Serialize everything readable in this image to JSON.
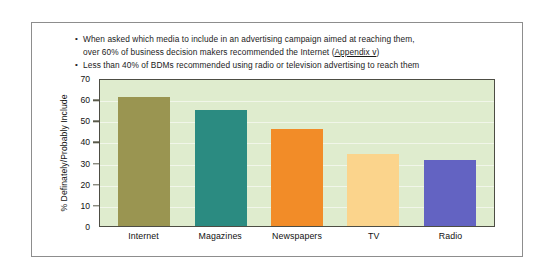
{
  "slide": {
    "bullets": [
      {
        "marker": "•",
        "line1": "When asked which media to include in an advertising campaign aimed at reaching them,",
        "line2_before": "over 60% of business decision makers recommended the Internet (",
        "line2_link": "Appendix v",
        "line2_after": ")"
      },
      {
        "marker": "•",
        "line1": "Less than 40% of BDMs recommended using radio or television advertising to reach them",
        "line2_before": "",
        "line2_link": "",
        "line2_after": ""
      }
    ]
  },
  "chart_data": {
    "type": "bar",
    "title": "",
    "xlabel": "",
    "ylabel": "% Definately/Probably Include",
    "ylim": [
      0,
      70
    ],
    "ytick_labels": [
      "70",
      "60",
      "50",
      "40",
      "30",
      "20",
      "10",
      "0"
    ],
    "ytick_values": [
      70,
      60,
      50,
      40,
      30,
      20,
      10,
      0
    ],
    "grid": true,
    "legend": "none",
    "plot_background": "#dfecce",
    "axis_color": "#4d4d44",
    "categories": [
      "Internet",
      "Magazines",
      "Newspapers",
      "TV",
      "Radio"
    ],
    "values": [
      61,
      55,
      46,
      34,
      31
    ],
    "bar_colors": [
      "#9a9551",
      "#2b8b81",
      "#f28c28",
      "#fbd48c",
      "#6363c2"
    ]
  }
}
